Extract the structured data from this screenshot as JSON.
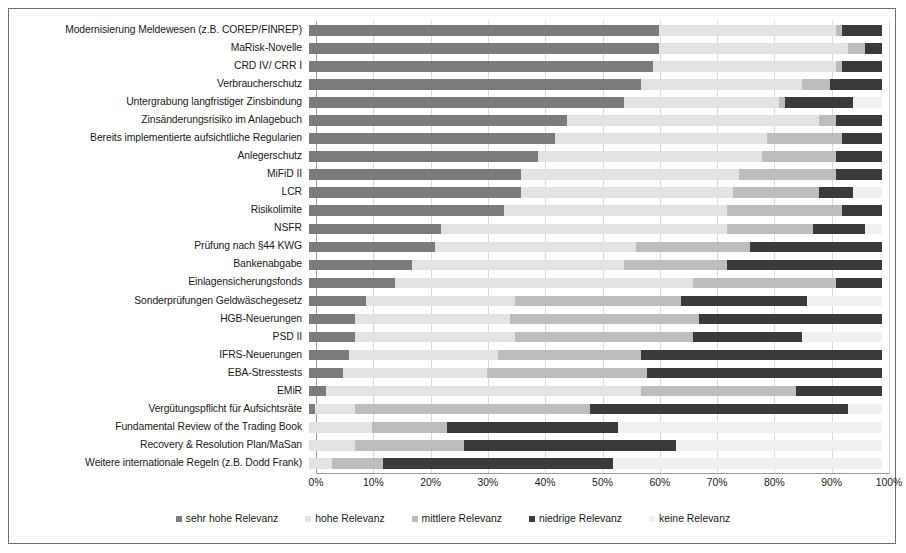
{
  "chart_data": {
    "type": "bar",
    "orientation": "horizontal",
    "stacked": true,
    "stack_mode": "percent",
    "title": "",
    "subtitle": "",
    "xlabel": "",
    "ylabel": "",
    "xlim": [
      0,
      100
    ],
    "grid": true,
    "legend_position": "bottom",
    "xticks": [
      "0%",
      "10%",
      "20%",
      "30%",
      "40%",
      "50%",
      "60%",
      "70%",
      "80%",
      "90%",
      "100%"
    ],
    "xtick_values": [
      0,
      10,
      20,
      30,
      40,
      50,
      60,
      70,
      80,
      90,
      100
    ],
    "series": [
      {
        "name": "sehr hohe Relevanz",
        "color": "#7b7b7b"
      },
      {
        "name": "hohe Relevanz",
        "color": "#e3e3e3"
      },
      {
        "name": "mittlere Relevanz",
        "color": "#bdbdbd"
      },
      {
        "name": "niedrige Relevanz",
        "color": "#3a3a3a"
      },
      {
        "name": "keine Relevanz",
        "color": "#f0f0f0"
      }
    ],
    "categories": [
      "Modernisierung Meldewesen (z.B. COREP/FINREP)",
      "MaRisk-Novelle",
      "CRD IV/ CRR I",
      "Verbraucherschutz",
      "Untergrabung langfristiger Zinsbindung",
      "Zinsänderungsrisiko im Anlagebuch",
      "Bereits implementierte aufsichtliche Regularien",
      "Anlegerschutz",
      "MiFiD II",
      "LCR",
      "Risikolimite",
      "NSFR",
      "Prüfung nach §44 KWG",
      "Bankenabgabe",
      "Einlagensicherungsfonds",
      "Sonderprüfungen Geldwäschegesetz",
      "HGB-Neuerungen",
      "PSD II",
      "IFRS-Neuerungen",
      "EBA-Stresstests",
      "EMiR",
      "Vergütungspflicht für Aufsichtsräte",
      "Fundamental Review of the Trading Book",
      "Recovery & Resolution Plan/MaSan",
      "Weitere internationale Regeln (z.B. Dodd Frank)"
    ],
    "rows": [
      {
        "category": "Modernisierung Meldewesen (z.B. COREP/FINREP)",
        "values": [
          61,
          31,
          1,
          7,
          0
        ]
      },
      {
        "category": "MaRisk-Novelle",
        "values": [
          61,
          33,
          3,
          3,
          0
        ]
      },
      {
        "category": "CRD IV/ CRR I",
        "values": [
          60,
          32,
          1,
          7,
          0
        ]
      },
      {
        "category": "Verbraucherschutz",
        "values": [
          58,
          28,
          5,
          9,
          0
        ]
      },
      {
        "category": "Untergrabung langfristiger Zinsbindung",
        "values": [
          55,
          27,
          1,
          12,
          5
        ]
      },
      {
        "category": "Zinsänderungsrisiko im Anlagebuch",
        "values": [
          45,
          44,
          3,
          8,
          0
        ]
      },
      {
        "category": "Bereits implementierte aufsichtliche Regularien",
        "values": [
          43,
          37,
          13,
          7,
          0
        ]
      },
      {
        "category": "Anlegerschutz",
        "values": [
          40,
          39,
          13,
          8,
          0
        ]
      },
      {
        "category": "MiFiD II",
        "values": [
          37,
          38,
          17,
          8,
          0
        ]
      },
      {
        "category": "LCR",
        "values": [
          37,
          37,
          15,
          6,
          5
        ]
      },
      {
        "category": "Risikolimite",
        "values": [
          34,
          39,
          20,
          7,
          0
        ]
      },
      {
        "category": "NSFR",
        "values": [
          23,
          50,
          15,
          9,
          3
        ]
      },
      {
        "category": "Prüfung nach §44 KWG",
        "values": [
          22,
          35,
          20,
          23,
          0
        ]
      },
      {
        "category": "Bankenabgabe",
        "values": [
          18,
          37,
          18,
          27,
          0
        ]
      },
      {
        "category": "Einlagensicherungsfonds",
        "values": [
          15,
          52,
          25,
          8,
          0
        ]
      },
      {
        "category": "Sonderprüfungen Geldwäschegesetz",
        "values": [
          10,
          26,
          29,
          22,
          13
        ]
      },
      {
        "category": "HGB-Neuerungen",
        "values": [
          8,
          27,
          33,
          32,
          0
        ]
      },
      {
        "category": "PSD II",
        "values": [
          8,
          28,
          31,
          19,
          14
        ]
      },
      {
        "category": "IFRS-Neuerungen",
        "values": [
          7,
          26,
          25,
          42,
          0
        ]
      },
      {
        "category": "EBA-Stresstests",
        "values": [
          6,
          25,
          28,
          41,
          0
        ]
      },
      {
        "category": "EMiR",
        "values": [
          3,
          55,
          27,
          15,
          0
        ]
      },
      {
        "category": "Vergütungspflicht für Aufsichtsräte",
        "values": [
          1,
          7,
          41,
          45,
          6
        ]
      },
      {
        "category": "Fundamental Review of the Trading Book",
        "values": [
          0,
          11,
          13,
          30,
          46
        ]
      },
      {
        "category": "Recovery & Resolution Plan/MaSan",
        "values": [
          0,
          8,
          19,
          37,
          36
        ]
      },
      {
        "category": "Weitere internationale Regeln (z.B. Dodd Frank)",
        "values": [
          0,
          4,
          9,
          40,
          47
        ]
      }
    ]
  },
  "legend": {
    "items": [
      {
        "label": "sehr hohe Relevanz",
        "color": "#7b7b7b"
      },
      {
        "label": "hohe Relevanz",
        "color": "#e3e3e3"
      },
      {
        "label": "mittlere Relevanz",
        "color": "#bdbdbd"
      },
      {
        "label": "niedrige Relevanz",
        "color": "#3a3a3a"
      },
      {
        "label": "keine Relevanz",
        "color": "#f0f0f0"
      }
    ]
  }
}
